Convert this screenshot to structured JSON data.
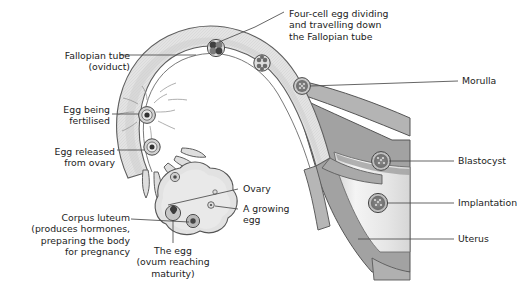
{
  "figure": {
    "title_alt": "Human female reproductive tract: ovulation, fertilisation and implantation",
    "background_color": "#ffffff",
    "line_color": "#4a4a4a",
    "text_color": "#1b1b1b",
    "tube_wall_color": "#9a9a9a",
    "tube_lumen_color": "#dcdcdc",
    "uterus_wall_color": "#9c9c9c",
    "uterus_cavity_color": "#ededed",
    "embryo_color": "#7d7d7d"
  },
  "labels": {
    "fallopian_tube": {
      "lines": [
        "Fallopian tube",
        "(oviduct)"
      ],
      "align": "right",
      "x": 28,
      "y": 50
    },
    "egg_being_fertilised": {
      "lines": [
        "Egg being",
        "fertilised"
      ],
      "align": "right",
      "x": 50,
      "y": 104
    },
    "egg_released": {
      "lines": [
        "Egg released",
        "from ovary"
      ],
      "align": "right",
      "x": 33,
      "y": 146
    },
    "corpus_luteum": {
      "lines": [
        "Corpus luteum",
        "(produces hormones,",
        "preparing the body",
        "for pregnancy"
      ],
      "align": "right",
      "x": 4,
      "y": 212
    },
    "four_cell_egg": {
      "lines": [
        "Four-cell egg dividing",
        "and travelling down",
        "the Fallopian tube"
      ],
      "align": "left",
      "x": 289,
      "y": 8
    },
    "morulla": {
      "lines": [
        "Morulla"
      ],
      "align": "left",
      "x": 462,
      "y": 78
    },
    "blastocyst": {
      "lines": [
        "Blastocyst"
      ],
      "align": "left",
      "x": 458,
      "y": 157
    },
    "implantation": {
      "lines": [
        "Implantation"
      ],
      "align": "left",
      "x": 458,
      "y": 199
    },
    "uterus": {
      "lines": [
        "Uterus"
      ],
      "align": "left",
      "x": 458,
      "y": 235
    },
    "ovary": {
      "lines": [
        "Ovary"
      ],
      "align": "left",
      "x": 243,
      "y": 186
    },
    "growing_egg": {
      "lines": [
        "A growing",
        "egg"
      ],
      "align": "left",
      "x": 243,
      "y": 207
    },
    "the_egg": {
      "lines": [
        "The egg",
        "(ovum reaching",
        "maturity)"
      ],
      "align": "center",
      "x": 148,
      "y": 248
    }
  },
  "structures": {
    "stages": [
      {
        "name": "egg-being-fertilised",
        "stage": "fertilisation",
        "cx": 147,
        "cy": 115
      },
      {
        "name": "egg-released-from-ovary",
        "stage": "ovum",
        "cx": 152,
        "cy": 147
      },
      {
        "name": "four-cell-egg",
        "stage": "4-cell",
        "cx": 216,
        "cy": 48
      },
      {
        "name": "eight-cell-egg",
        "stage": "8-cell",
        "cx": 262,
        "cy": 63
      },
      {
        "name": "morulla",
        "stage": "morula",
        "cx": 302,
        "cy": 86
      },
      {
        "name": "blastocyst",
        "stage": "blastocyst",
        "cx": 381,
        "cy": 161
      },
      {
        "name": "implantation",
        "stage": "implanted",
        "cx": 378,
        "cy": 203
      }
    ],
    "ovary_follicles": [
      {
        "name": "mature-ovum",
        "cx": 173,
        "cy": 213,
        "r": 7.5
      },
      {
        "name": "corpus-luteum-body",
        "cx": 193,
        "cy": 221,
        "r": 6.5
      },
      {
        "name": "developing-follicle",
        "cx": 175,
        "cy": 177,
        "r": 4.5
      },
      {
        "name": "growing-egg",
        "cx": 211,
        "cy": 205,
        "r": 3.2
      },
      {
        "name": "small-follicle",
        "cx": 215,
        "cy": 192,
        "r": 2.2
      }
    ]
  }
}
